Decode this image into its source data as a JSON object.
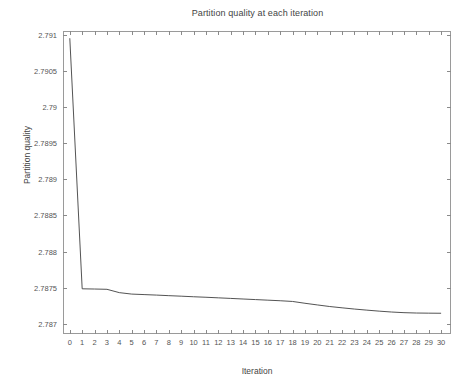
{
  "chart_data": {
    "type": "line",
    "title": "Partition quality at each iteration",
    "xlabel": "Iteration",
    "ylabel": "Partition quality",
    "grid": false,
    "legend": null,
    "xlim": [
      -0.55,
      30.8
    ],
    "ylim": [
      2.78686,
      2.79105
    ],
    "xticks": [
      0,
      1,
      2,
      3,
      4,
      5,
      6,
      7,
      8,
      9,
      10,
      11,
      12,
      13,
      14,
      15,
      16,
      17,
      18,
      19,
      20,
      21,
      22,
      23,
      24,
      25,
      26,
      27,
      28,
      29,
      30
    ],
    "xtick_labels": [
      "0",
      "1",
      "2",
      "3",
      "4",
      "5",
      "6",
      "7",
      "8",
      "9",
      "10",
      "11",
      "12",
      "13",
      "14",
      "15",
      "16",
      "17",
      "18",
      "19",
      "20",
      "21",
      "22",
      "23",
      "24",
      "25",
      "26",
      "27",
      "28",
      "29",
      "30"
    ],
    "yticks": [
      2.787,
      2.7875,
      2.788,
      2.7885,
      2.789,
      2.7895,
      2.79,
      2.7905,
      2.791
    ],
    "ytick_labels": [
      "2.787",
      "2.7875",
      "2.788",
      "2.7885",
      "2.789",
      "2.7895",
      "2.79",
      "2.7905",
      "2.791"
    ],
    "x": [
      0,
      1,
      2,
      3,
      4,
      5,
      6,
      7,
      8,
      9,
      10,
      11,
      12,
      13,
      14,
      15,
      16,
      17,
      18,
      19,
      20,
      21,
      22,
      23,
      24,
      25,
      26,
      27,
      28,
      29,
      30
    ],
    "values": [
      2.79095,
      2.787485,
      2.787482,
      2.787478,
      2.787432,
      2.787412,
      2.787405,
      2.787398,
      2.78739,
      2.787383,
      2.787375,
      2.787368,
      2.78736,
      2.787352,
      2.787344,
      2.787336,
      2.787328,
      2.78732,
      2.78731,
      2.787285,
      2.787262,
      2.78724,
      2.787222,
      2.787205,
      2.78719,
      2.787176,
      2.787164,
      2.787155,
      2.78715,
      2.787148,
      2.787147
    ],
    "series": [
      {
        "name": "Partition quality",
        "color": "#3f3f3f",
        "values": [
          2.79095,
          2.787485,
          2.787482,
          2.787478,
          2.787432,
          2.787412,
          2.787405,
          2.787398,
          2.78739,
          2.787383,
          2.787375,
          2.787368,
          2.78736,
          2.787352,
          2.787344,
          2.787336,
          2.787328,
          2.78732,
          2.78731,
          2.787285,
          2.787262,
          2.78724,
          2.787222,
          2.787205,
          2.78719,
          2.787176,
          2.787164,
          2.787155,
          2.78715,
          2.787148,
          2.787147
        ]
      }
    ]
  },
  "colors": {
    "background": "#ffffff",
    "axis": "#9a9a9a",
    "text": "#444444",
    "line": "#3f3f3f"
  }
}
